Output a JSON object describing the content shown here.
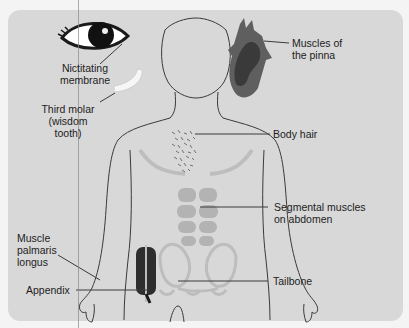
{
  "diagram": {
    "colors": {
      "background": "#f4f4f4",
      "panel": "#d8d8d8",
      "outline": "#3a3a3a",
      "muscle": "#b3b3b3",
      "ear": "#5a5a5a",
      "appendix": "#2e2e2e"
    },
    "labels": {
      "nictitating": "Nictitating membrane",
      "nictitating_l1": "Nictitating",
      "nictitating_l2": "membrane",
      "molar_l1": "Third molar",
      "molar_l2": "(wisdom",
      "molar_l3": "tooth)",
      "pinna_l1": "Muscles of",
      "pinna_l2": "the pinna",
      "body_hair": "Body hair",
      "segmental_l1": "Segmental muscles",
      "segmental_l2": "on abdomen",
      "palmaris_l1": "Muscle",
      "palmaris_l2": "palmaris",
      "palmaris_l3": "longus",
      "appendix": "Appendix",
      "tailbone": "Tailbone"
    }
  }
}
